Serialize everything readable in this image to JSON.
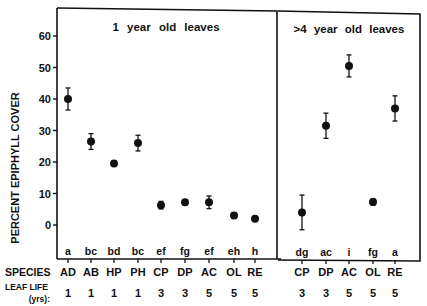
{
  "chart_data": {
    "type": "scatter",
    "ylabel": "PERCENT EPIPHYLL COVER",
    "ylim": [
      -10,
      68
    ],
    "yticks": [
      0,
      10,
      20,
      30,
      40,
      50,
      60
    ],
    "grid": false,
    "panels": [
      {
        "title": "1 year old leaves",
        "species": [
          "AD",
          "AB",
          "HP",
          "PH",
          "CP",
          "DP",
          "AC",
          "OL",
          "RE"
        ],
        "leaf_life_yrs": [
          "1",
          "1",
          "1",
          "1",
          "3",
          "3",
          "5",
          "5",
          "5"
        ],
        "letters": [
          "a",
          "bc",
          "bd",
          "bc",
          "ef",
          "fg",
          "ef",
          "eh",
          "h"
        ],
        "values": [
          40,
          26.5,
          19.5,
          26,
          6.3,
          7.2,
          7.2,
          3,
          2
        ],
        "errors": [
          3.5,
          2.5,
          0.6,
          2.5,
          1.2,
          0.8,
          2,
          0.6,
          0.5
        ]
      },
      {
        "title": ">4 year old leaves",
        "species": [
          "CP",
          "DP",
          "AC",
          "OL",
          "RE"
        ],
        "leaf_life_yrs": [
          "3",
          "3",
          "5",
          "5",
          "5"
        ],
        "letters": [
          "dg",
          "ac",
          "i",
          "fg",
          "a"
        ],
        "values": [
          4,
          31.5,
          50.5,
          7.3,
          37
        ],
        "errors": [
          5.5,
          4,
          3.5,
          1,
          4
        ]
      }
    ],
    "row_labels": {
      "species": "SPECIES",
      "leaf_life_line1": "LEAF LIFE",
      "leaf_life_line2": "(yrs):"
    }
  }
}
